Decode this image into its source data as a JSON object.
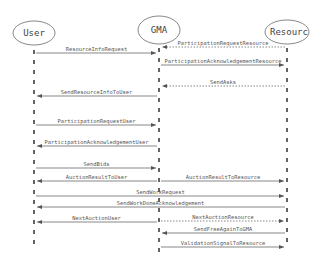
{
  "diagram": {
    "type": "sequence",
    "actors": [
      {
        "id": "user",
        "label": "User",
        "x": 34
      },
      {
        "id": "gma",
        "label": "GMA",
        "x": 159
      },
      {
        "id": "resource",
        "label": "Resourc",
        "x": 287
      }
    ],
    "messages": [
      {
        "label": "ParticipationRequestResource",
        "from": "resource",
        "to": "gma",
        "y": 47,
        "style": "dashed"
      },
      {
        "label": "ResourceInfoRequest",
        "from": "user",
        "to": "gma",
        "y": 53,
        "style": "solid"
      },
      {
        "label": "ParticipationAcknowledgementResource",
        "from": "gma",
        "to": "resource",
        "y": 65,
        "style": "solid"
      },
      {
        "label": "SendAsks",
        "from": "resource",
        "to": "gma",
        "y": 86,
        "style": "dashed"
      },
      {
        "label": "SendResourceInfoToUser",
        "from": "gma",
        "to": "user",
        "y": 96,
        "style": "solid"
      },
      {
        "label": "ParticipationRequestUser",
        "from": "user",
        "to": "gma",
        "y": 125,
        "style": "solid"
      },
      {
        "label": "ParticipationAcknowledgementUser",
        "from": "gma",
        "to": "user",
        "y": 146,
        "style": "solid"
      },
      {
        "label": "SendBids",
        "from": "user",
        "to": "gma",
        "y": 168,
        "style": "solid"
      },
      {
        "label": "AuctionResultToUser",
        "from": "gma",
        "to": "user",
        "y": 181,
        "style": "solid"
      },
      {
        "label": "AuctionResultToResource",
        "from": "gma",
        "to": "resource",
        "y": 181,
        "style": "solid"
      },
      {
        "label": "SendWorkRequest",
        "from": "user",
        "to": "resource",
        "y": 196,
        "style": "solid"
      },
      {
        "label": "SendWorkDoneAcknowledgement",
        "from": "resource",
        "to": "user",
        "y": 207,
        "style": "solid"
      },
      {
        "label": "NextAuctionUser",
        "from": "gma",
        "to": "user",
        "y": 222,
        "style": "solid"
      },
      {
        "label": "NextAuctionResource",
        "from": "gma",
        "to": "resource",
        "y": 221,
        "style": "dashed"
      },
      {
        "label": "SendFreeAgainToGMA",
        "from": "resource",
        "to": "gma",
        "y": 233,
        "style": "solid"
      },
      {
        "label": "ValidationSignalToResource",
        "from": "gma",
        "to": "resource",
        "y": 247,
        "style": "solid"
      }
    ],
    "colors": {
      "line": "#555555",
      "text": "#444444",
      "lifeline": "#222222"
    }
  }
}
